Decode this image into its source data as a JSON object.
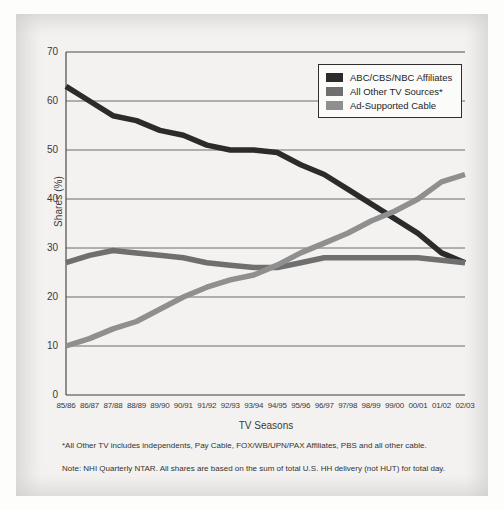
{
  "chart_data": {
    "type": "line",
    "title": "",
    "xlabel": "TV Seasons",
    "ylabel": "Shares (%)",
    "ylim": [
      0,
      70
    ],
    "ytick_step": 10,
    "yticks": [
      0,
      10,
      20,
      30,
      40,
      50,
      60,
      70
    ],
    "grid": "horizontal",
    "legend_position": "top-right",
    "categories": [
      "85/86",
      "86/87",
      "87/88",
      "88/89",
      "89/90",
      "90/91",
      "91/92",
      "92/93",
      "93/94",
      "94/95",
      "95/96",
      "96/97",
      "97/98",
      "98/99",
      "99/00",
      "00/01",
      "01/02",
      "02/03"
    ],
    "series": [
      {
        "name": "ABC/CBS/NBC Affiliates",
        "color": "#2b2b2b",
        "values": [
          63,
          60,
          57,
          56,
          54,
          53,
          51,
          50,
          50,
          49.5,
          47,
          45,
          42,
          39,
          36,
          33,
          29,
          27
        ]
      },
      {
        "name": "All Other TV Sources*",
        "color": "#6f6f6f",
        "values": [
          27,
          28.5,
          29.5,
          29,
          28.5,
          28,
          27,
          26.5,
          26,
          26,
          27,
          28,
          28,
          28,
          28,
          28,
          27.5,
          27
        ]
      },
      {
        "name": "Ad-Supported Cable",
        "color": "#8f8f8f",
        "values": [
          10,
          11.5,
          13.5,
          15,
          17.5,
          20,
          22,
          23.5,
          24.5,
          26.5,
          29,
          31,
          33,
          35.5,
          37.5,
          40,
          43.5,
          45
        ]
      }
    ]
  },
  "legend": {
    "items": [
      {
        "label": "ABC/CBS/NBC Affiliates",
        "color": "#2b2b2b"
      },
      {
        "label": "All Other TV Sources*",
        "color": "#6f6f6f"
      },
      {
        "label": "Ad-Supported Cable",
        "color": "#8f8f8f"
      }
    ]
  },
  "footnotes": [
    "*All Other TV includes independents, Pay Cable, FOX/WB/UPN/PAX Affiliates, PBS and all other cable.",
    "Note: NHI Quarterly NTAR. All shares are based on the sum of total U.S. HH delivery (not HUT) for total day."
  ]
}
